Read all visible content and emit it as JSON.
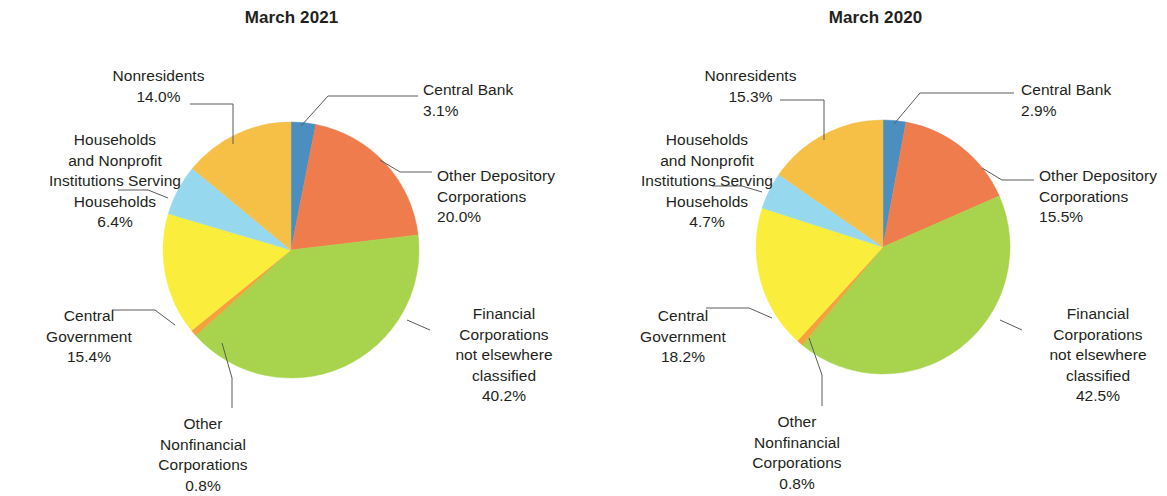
{
  "figure": {
    "background_color": "#ffffff",
    "text_color": "#231f20"
  },
  "palette": {
    "central_bank": "#4a8fc0",
    "other_depository_corporations": "#ef7c4d",
    "financial_corporations_nec": "#a7d44c",
    "other_nonfinancial_corporations": "#f5a13c",
    "central_government": "#faed3c",
    "households_npish": "#96d9ef",
    "nonresidents": "#f6bf46",
    "leader_line": "#5a5a5a"
  },
  "charts": [
    {
      "title": "March 2021",
      "labels": [
        {
          "name": "central-bank",
          "text": "Central Bank\n3.1%",
          "align": "left"
        },
        {
          "name": "other-depository-corporations",
          "text": "Other Depository\nCorporations\n20.0%",
          "align": "left"
        },
        {
          "name": "financial-corporations-nec",
          "text": "Financial\nCorporations\nnot elsewhere\nclassified\n40.2%",
          "align": "center"
        },
        {
          "name": "other-nonfinancial-corporations",
          "text": "Other\nNonfinancial\nCorporations\n0.8%",
          "align": "center"
        },
        {
          "name": "central-government",
          "text": "Central\nGovernment\n15.4%",
          "align": "center"
        },
        {
          "name": "households-npish",
          "text": "Households\nand Nonprofit\nInstitutions Serving\nHouseholds\n6.4%",
          "align": "center"
        },
        {
          "name": "nonresidents",
          "text": "Nonresidents\n14.0%",
          "align": "center"
        }
      ]
    },
    {
      "title": "March 2020",
      "labels": [
        {
          "name": "central-bank",
          "text": "Central Bank\n2.9%",
          "align": "left"
        },
        {
          "name": "other-depository-corporations",
          "text": "Other Depository\nCorporations\n15.5%",
          "align": "left"
        },
        {
          "name": "financial-corporations-nec",
          "text": "Financial\nCorporations\nnot elsewhere\nclassified\n42.5%",
          "align": "center"
        },
        {
          "name": "other-nonfinancial-corporations",
          "text": "Other\nNonfinancial\nCorporations\n0.8%",
          "align": "center"
        },
        {
          "name": "central-government",
          "text": "Central\nGovernment\n18.2%",
          "align": "center"
        },
        {
          "name": "households-npish",
          "text": "Households\nand Nonprofit\nInstitutions Serving\nHouseholds\n4.7%",
          "align": "center"
        },
        {
          "name": "nonresidents",
          "text": "Nonresidents\n15.3%",
          "align": "center"
        }
      ]
    }
  ],
  "chart_data": [
    {
      "type": "pie",
      "title": "March 2021",
      "labels": [
        "Central Bank",
        "Other Depository Corporations",
        "Financial Corporations not elsewhere classified",
        "Other Nonfinancial Corporations",
        "Central Government",
        "Households and Nonprofit Institutions Serving Households",
        "Nonresidents"
      ],
      "values": [
        3.1,
        20.0,
        40.2,
        0.8,
        15.4,
        6.4,
        14.0
      ],
      "value_labels": [
        "3.1%",
        "20.0%",
        "40.2%",
        "0.8%",
        "15.4%",
        "6.4%",
        "14.0%"
      ],
      "colors": [
        "#4a8fc0",
        "#ef7c4d",
        "#a7d44c",
        "#f5a13c",
        "#faed3c",
        "#96d9ef",
        "#f6bf46"
      ],
      "units": "percent",
      "start_angle_deg": 0,
      "direction": "clockwise",
      "legend": "none",
      "labels_position": "outside-with-leader-lines"
    },
    {
      "type": "pie",
      "title": "March 2020",
      "labels": [
        "Central Bank",
        "Other Depository Corporations",
        "Financial Corporations not elsewhere classified",
        "Other Nonfinancial Corporations",
        "Central Government",
        "Households and Nonprofit Institutions Serving Households",
        "Nonresidents"
      ],
      "values": [
        2.9,
        15.5,
        42.5,
        0.8,
        18.2,
        4.7,
        15.3
      ],
      "value_labels": [
        "2.9%",
        "15.5%",
        "42.5%",
        "0.8%",
        "18.2%",
        "4.7%",
        "15.3%"
      ],
      "colors": [
        "#4a8fc0",
        "#ef7c4d",
        "#a7d44c",
        "#f5a13c",
        "#faed3c",
        "#96d9ef",
        "#f6bf46"
      ],
      "units": "percent",
      "start_angle_deg": 0,
      "direction": "clockwise",
      "legend": "none",
      "labels_position": "outside-with-leader-lines"
    }
  ],
  "geometry": {
    "pies": [
      {
        "cx": 291,
        "cy": 250,
        "r": 128
      },
      {
        "cx": 299,
        "cy": 247,
        "r": 127
      }
    ],
    "label_positions": [
      [
        {
          "name": "central-bank",
          "x": 423,
          "y": 80,
          "w": 150
        },
        {
          "name": "other-depository-corporations",
          "x": 437,
          "y": 166,
          "w": 150
        },
        {
          "name": "financial-corporations-nec",
          "x": 432,
          "y": 304,
          "w": 144
        },
        {
          "name": "other-nonfinancial-corporations",
          "x": 118,
          "y": 414,
          "w": 170
        },
        {
          "name": "central-government",
          "x": 19,
          "y": 306,
          "w": 140
        },
        {
          "name": "households-npish",
          "x": 17,
          "y": 130,
          "w": 196
        },
        {
          "name": "nonresidents",
          "x": 81,
          "y": 66,
          "w": 155
        }
      ],
      [
        {
          "name": "central-bank",
          "x": 437,
          "y": 80,
          "w": 150
        },
        {
          "name": "other-depository-corporations",
          "x": 455,
          "y": 166,
          "w": 150
        },
        {
          "name": "financial-corporations-nec",
          "x": 442,
          "y": 304,
          "w": 144
        },
        {
          "name": "other-nonfinancial-corporations",
          "x": 128,
          "y": 412,
          "w": 170
        },
        {
          "name": "central-government",
          "x": 29,
          "y": 306,
          "w": 140
        },
        {
          "name": "households-npish",
          "x": 25,
          "y": 130,
          "w": 196
        },
        {
          "name": "nonresidents",
          "x": 89,
          "y": 66,
          "w": 155
        }
      ]
    ],
    "leaders": [
      [
        {
          "name": "central-bank",
          "points": "301,126 328,96 418,96"
        },
        {
          "name": "other-depository-corporations",
          "points": "380,160 400,172 432,172"
        },
        {
          "name": "financial-corporations-nec",
          "points": "407,320 430,330"
        },
        {
          "name": "other-nonfinancial-corporations",
          "points": "222,343 232,378 232,408"
        },
        {
          "name": "central-government",
          "points": "175,325 155,310 112,310"
        },
        {
          "name": "households-npish",
          "points": "168,198 148,190 118,190"
        },
        {
          "name": "nonresidents",
          "points": "233,144 233,104 190,104"
        }
      ],
      [
        {
          "name": "central-bank",
          "points": "310,124 336,93 430,93"
        },
        {
          "name": "other-depository-corporations",
          "points": "398,168 418,180 450,180"
        },
        {
          "name": "financial-corporations-nec",
          "points": "416,320 438,330"
        },
        {
          "name": "other-nonfinancial-corporations",
          "points": "225,338 238,375 238,406"
        },
        {
          "name": "central-government",
          "points": "188,318 165,308 122,308"
        },
        {
          "name": "households-npish",
          "points": "178,192 158,186 128,186"
        },
        {
          "name": "nonresidents",
          "points": "240,140 240,100 196,100"
        }
      ]
    ]
  }
}
